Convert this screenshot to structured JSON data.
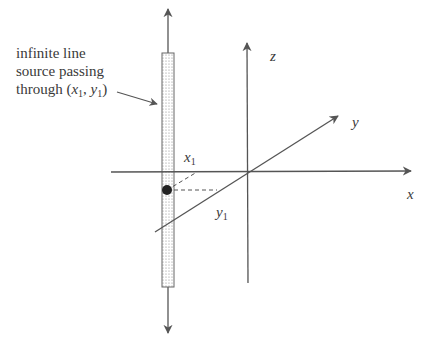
{
  "diagram": {
    "caption": {
      "line1": "infinite line",
      "line2": "source passing",
      "line3_prefix": "through (",
      "line3_x": "x",
      "line3_x_sub": "1",
      "line3_sep": ", ",
      "line3_y": "y",
      "line3_y_sub": "1",
      "line3_suffix": ")"
    },
    "axes": {
      "x_label": "x",
      "y_label": "y",
      "z_label": "z"
    },
    "point_labels": {
      "x1_main": "x",
      "x1_sub": "1",
      "y1_main": "y",
      "y1_sub": "1"
    },
    "colors": {
      "line": "#555555",
      "text": "#3a3a3a",
      "dot": "#222222",
      "stipple": "#888888"
    }
  }
}
